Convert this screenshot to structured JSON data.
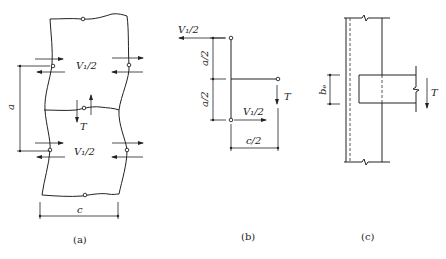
{
  "figure": {
    "panels": [
      {
        "id": "a",
        "caption": "(a)",
        "labels": {
          "shear_top": "V₁/2",
          "shear_bottom": "V₁/2",
          "torque": "T",
          "height_dim": "a",
          "width_dim": "c"
        }
      },
      {
        "id": "b",
        "caption": "(b)",
        "labels": {
          "shear_top": "V₁/2",
          "shear_bottom": "V₁/2",
          "torque": "T",
          "half_height_top": "a/2",
          "half_height_bottom": "a/2",
          "half_width": "c/2"
        }
      },
      {
        "id": "c",
        "caption": "(c)",
        "labels": {
          "beam_width": "bₑ",
          "torque": "T"
        }
      }
    ]
  }
}
